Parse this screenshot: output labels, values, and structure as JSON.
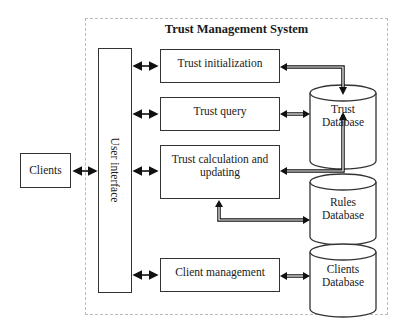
{
  "diagram": {
    "title": "Trust Management System",
    "external": {
      "clients": "Clients"
    },
    "user_interface": "User interface",
    "modules": [
      {
        "id": "trust-initialization",
        "label": "Trust initialization"
      },
      {
        "id": "trust-query",
        "label": "Trust query"
      },
      {
        "id": "trust-calculation",
        "label_line1": "Trust calculation and",
        "label_line2": "updating"
      },
      {
        "id": "client-management",
        "label": "Client management"
      }
    ],
    "databases": [
      {
        "id": "trust-db",
        "line1": "Trust",
        "line2": "Database"
      },
      {
        "id": "rules-db",
        "line1": "Rules",
        "line2": "Database"
      },
      {
        "id": "clients-db",
        "line1": "Clients",
        "line2": "Database"
      }
    ],
    "connections": [
      "Clients <-> User interface",
      "User interface <-> Trust initialization",
      "User interface <-> Trust query",
      "User interface <-> Trust calculation and updating",
      "User interface <-> Client management",
      "Trust initialization <-> Trust Database",
      "Trust query <-> Trust Database",
      "Trust calculation and updating <-> Trust Database",
      "Trust calculation and updating <-> Rules Database",
      "Client management <-> Clients Database"
    ]
  }
}
